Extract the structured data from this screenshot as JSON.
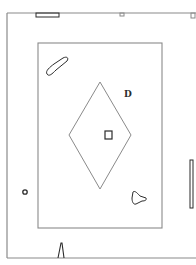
{
  "sketch": {
    "width": 196,
    "height": 265,
    "stroke_light": "#8a8a8a",
    "stroke_dark": "#2b2b2b",
    "background": "#ffffff",
    "outer_frame": {
      "x": 7,
      "y": 13,
      "right": 198,
      "bottom": 258
    },
    "top_notches": [
      {
        "x": 36,
        "y": 13,
        "w": 23,
        "h": 4
      },
      {
        "x": 120,
        "y": 13,
        "w": 4,
        "h": 3
      },
      {
        "x": 191,
        "y": 13,
        "w": 4,
        "h": 5
      }
    ],
    "inner_frame": {
      "x": 38,
      "y": 43,
      "w": 124,
      "h": 185
    },
    "diamond": {
      "top": [
        100,
        82
      ],
      "right": [
        131,
        135
      ],
      "bottom": [
        100,
        189
      ],
      "left": [
        69,
        135
      ]
    },
    "center_square": {
      "x": 105,
      "y": 131,
      "w": 7,
      "h": 8
    },
    "crescent_mark": {
      "x": 124,
      "y": 91,
      "glyph": "D"
    },
    "blob_top_left": "M47,74 C45,71 50,67 54,64 L63,58 C67,56 69,58 67,61 L56,70 C52,74 49,77 47,74 Z",
    "blob_bottom_right": "M133,192 C135,190 138,194 140,196 L146,198 C147,200 145,201 142,201 L136,204 C133,205 132,201 132,198 Z",
    "small_circle": {
      "cx": 25,
      "cy": 192,
      "r": 2.2
    },
    "right_bar": {
      "x": 190,
      "y": 160,
      "w": 3,
      "h": 48
    },
    "bottom_spike": {
      "points": "58,258 61,243 62,243 64,258"
    }
  }
}
